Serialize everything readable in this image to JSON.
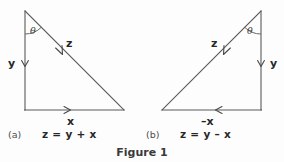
{
  "figure": {
    "caption": "Figure 1",
    "background_color": "#fdfdfd",
    "line_color": "#5a5a5a",
    "text_color": "#262626"
  },
  "panels": [
    {
      "id": "a",
      "label": "(a)",
      "equation": "z = y + x",
      "angle_label": "θ",
      "vectors": [
        {
          "name": "y",
          "label": "y",
          "direction": "down",
          "side": "vertical-left"
        },
        {
          "name": "x",
          "label": "x",
          "direction": "right",
          "side": "horizontal-bottom"
        },
        {
          "name": "z",
          "label": "z",
          "direction": "down-right",
          "side": "hypotenuse"
        }
      ],
      "geometry": {
        "apex": [
          25,
          11
        ],
        "corner": [
          25,
          110
        ],
        "far": [
          124,
          110
        ]
      }
    },
    {
      "id": "b",
      "label": "(b)",
      "equation": "z = y – x",
      "angle_label": "θ",
      "vectors": [
        {
          "name": "y",
          "label": "y",
          "direction": "down",
          "side": "vertical-right"
        },
        {
          "name": "minus-x",
          "label": "–x",
          "direction": "left",
          "side": "horizontal-bottom"
        },
        {
          "name": "z",
          "label": "z",
          "direction": "down-left",
          "side": "hypotenuse"
        }
      ],
      "geometry": {
        "apex": [
          261,
          11
        ],
        "corner": [
          261,
          110
        ],
        "far": [
          162,
          110
        ]
      }
    }
  ],
  "labels": {
    "panel_a": {
      "theta": "θ",
      "y": "y",
      "x": "x",
      "z": "z",
      "tag": "(a)",
      "equation": "z = y + x"
    },
    "panel_b": {
      "theta": "θ",
      "y": "y",
      "x": "–x",
      "z": "z",
      "tag": "(b)",
      "equation": "z = y – x"
    },
    "caption": "Figure 1"
  }
}
